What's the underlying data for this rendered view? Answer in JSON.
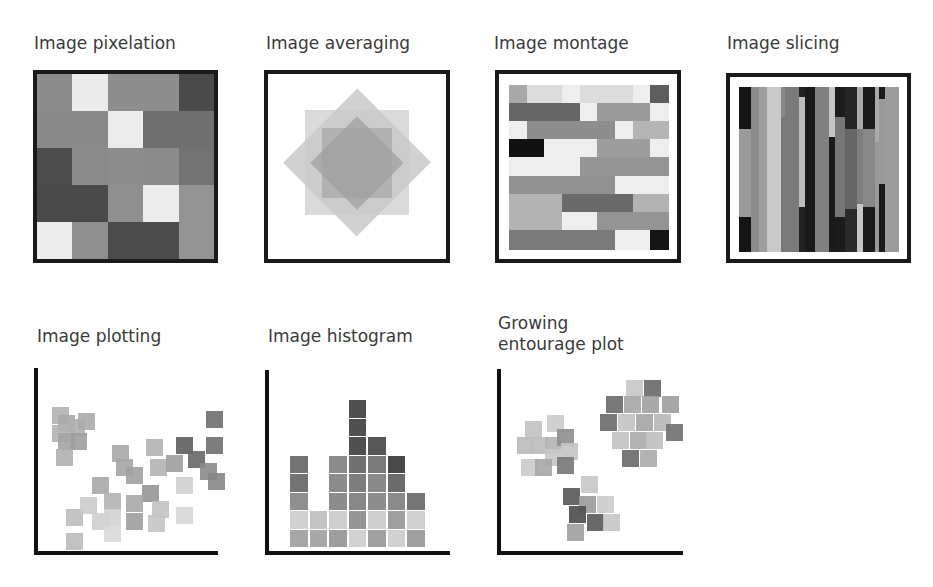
{
  "panels": [
    {
      "id": "pixelation",
      "title": "Image pixelation"
    },
    {
      "id": "averaging",
      "title": "Image averaging"
    },
    {
      "id": "montage",
      "title": "Image montage"
    },
    {
      "id": "slicing",
      "title": "Image slicing"
    },
    {
      "id": "plotting",
      "title": "Image plotting"
    },
    {
      "id": "histogram",
      "title": "Image histogram"
    },
    {
      "id": "entourage",
      "title_line1": "Growing",
      "title_line2": "entourage plot"
    }
  ],
  "pixelation_grid": {
    "rows": 5,
    "cols": 5,
    "shades": [
      [
        "#8c8c8c",
        "#ebebeb",
        "#8e8e8e",
        "#8e8e8e",
        "#4a4a4a"
      ],
      [
        "#8a8a8a",
        "#8a8a8a",
        "#ececec",
        "#6f6f6f",
        "#707070"
      ],
      [
        "#4d4d4d",
        "#8b8b8b",
        "#8d8d8d",
        "#8b8b8b",
        "#727272"
      ],
      [
        "#4a4a4a",
        "#4a4a4a",
        "#8f8f8f",
        "#ececec",
        "#949494"
      ],
      [
        "#ececec",
        "#8f8f8f",
        "#4b4b4b",
        "#4b4b4b",
        "#949494"
      ]
    ]
  },
  "averaging_shapes": [
    {
      "type": "square",
      "color": "#d9d9d9"
    },
    {
      "type": "diamond",
      "color": "#c8c8c8"
    },
    {
      "type": "inner-square",
      "color": "#b4b4b4"
    },
    {
      "type": "inner-diamond",
      "color": "#a3a3a3"
    }
  ],
  "montage_grid": {
    "rows": 9,
    "cols": 9,
    "shades": [
      [
        "#a9a9a9",
        "#dcdcdc",
        "#dcdcdc",
        "#eeeeee",
        "#dcdcdc",
        "#dcdcdc",
        "#dcdcdc",
        "#eeeeee",
        "#5e5e5e"
      ],
      [
        "#666666",
        "#666666",
        "#666666",
        "#666666",
        "#eeeeee",
        "#9a9a9a",
        "#9a9a9a",
        "#9a9a9a",
        "#eeeeee"
      ],
      [
        "#eeeeee",
        "#8e8e8e",
        "#8e8e8e",
        "#8e8e8e",
        "#8e8e8e",
        "#8e8e8e",
        "#eeeeee",
        "#b5b5b5",
        "#b5b5b5"
      ],
      [
        "#111111",
        "#111111",
        "#eeeeee",
        "#eeeeee",
        "#eeeeee",
        "#9d9d9d",
        "#9d9d9d",
        "#9d9d9d",
        "#eeeeee"
      ],
      [
        "#eeeeee",
        "#eeeeee",
        "#eeeeee",
        "#eeeeee",
        "#959595",
        "#959595",
        "#959595",
        "#959595",
        "#959595"
      ],
      [
        "#909090",
        "#909090",
        "#909090",
        "#909090",
        "#909090",
        "#909090",
        "#eeeeee",
        "#eeeeee",
        "#eeeeee"
      ],
      [
        "#b3b3b3",
        "#b3b3b3",
        "#b3b3b3",
        "#6a6a6a",
        "#6a6a6a",
        "#6a6a6a",
        "#6a6a6a",
        "#b3b3b3",
        "#b3b3b3"
      ],
      [
        "#b3b3b3",
        "#b3b3b3",
        "#b3b3b3",
        "#eeeeee",
        "#eeeeee",
        "#949494",
        "#949494",
        "#949494",
        "#949494"
      ],
      [
        "#7a7a7a",
        "#7a7a7a",
        "#7a7a7a",
        "#7a7a7a",
        "#7a7a7a",
        "#7a7a7a",
        "#eeeeee",
        "#eeeeee",
        "#151515"
      ]
    ]
  },
  "slicing_strips": [
    {
      "x": 0,
      "w": 12,
      "segments": [
        {
          "y": 0,
          "h": 42,
          "c": "#151515"
        },
        {
          "y": 42,
          "h": 88,
          "c": "#9a9a9a"
        },
        {
          "y": 130,
          "h": 35,
          "c": "#151515"
        }
      ]
    },
    {
      "x": 12,
      "w": 8,
      "segments": [
        {
          "y": 0,
          "h": 165,
          "c": "#8a8a8a"
        }
      ]
    },
    {
      "x": 20,
      "w": 8,
      "segments": [
        {
          "y": 0,
          "h": 165,
          "c": "#9e9e9e"
        }
      ]
    },
    {
      "x": 28,
      "w": 14,
      "segments": [
        {
          "y": 0,
          "h": 165,
          "c": "#c9c9c9"
        }
      ]
    },
    {
      "x": 42,
      "w": 4,
      "segments": [
        {
          "y": 0,
          "h": 30,
          "c": "#888"
        },
        {
          "y": 30,
          "h": 135,
          "c": "#777"
        }
      ]
    },
    {
      "x": 46,
      "w": 14,
      "segments": [
        {
          "y": 0,
          "h": 165,
          "c": "#7a7a7a"
        }
      ]
    },
    {
      "x": 60,
      "w": 6,
      "segments": [
        {
          "y": 0,
          "h": 10,
          "c": "#222"
        },
        {
          "y": 10,
          "h": 110,
          "c": "#bdbdbd"
        },
        {
          "y": 120,
          "h": 45,
          "c": "#222"
        }
      ]
    },
    {
      "x": 66,
      "w": 10,
      "segments": [
        {
          "y": 0,
          "h": 165,
          "c": "#1a1a1a"
        }
      ]
    },
    {
      "x": 76,
      "w": 14,
      "segments": [
        {
          "y": 0,
          "h": 165,
          "c": "#808080"
        }
      ]
    },
    {
      "x": 90,
      "w": 6,
      "segments": [
        {
          "y": 0,
          "h": 50,
          "c": "#c5c5c5"
        },
        {
          "y": 50,
          "h": 115,
          "c": "#1a1a1a"
        }
      ]
    },
    {
      "x": 96,
      "w": 10,
      "segments": [
        {
          "y": 0,
          "h": 30,
          "c": "#1c1c1c"
        },
        {
          "y": 30,
          "h": 100,
          "c": "#777"
        },
        {
          "y": 130,
          "h": 35,
          "c": "#1c1c1c"
        }
      ]
    },
    {
      "x": 106,
      "w": 12,
      "segments": [
        {
          "y": 0,
          "h": 42,
          "c": "#262626"
        },
        {
          "y": 42,
          "h": 80,
          "c": "#666"
        },
        {
          "y": 122,
          "h": 43,
          "c": "#2a2a2a"
        }
      ]
    },
    {
      "x": 118,
      "w": 6,
      "segments": [
        {
          "y": 0,
          "h": 42,
          "c": "#aaa"
        },
        {
          "y": 42,
          "h": 75,
          "c": "#7d7d7d"
        },
        {
          "y": 117,
          "h": 48,
          "c": "#c6c6c6"
        }
      ]
    },
    {
      "x": 124,
      "w": 12,
      "segments": [
        {
          "y": 0,
          "h": 42,
          "c": "#1a1a1a"
        },
        {
          "y": 42,
          "h": 78,
          "c": "#888"
        },
        {
          "y": 120,
          "h": 45,
          "c": "#1a1a1a"
        }
      ]
    },
    {
      "x": 136,
      "w": 4,
      "segments": [
        {
          "y": 0,
          "h": 55,
          "c": "#aaa"
        },
        {
          "y": 55,
          "h": 110,
          "c": "#999"
        }
      ]
    },
    {
      "x": 140,
      "w": 6,
      "segments": [
        {
          "y": 0,
          "h": 12,
          "c": "#1a1a1a"
        },
        {
          "y": 12,
          "h": 85,
          "c": "#9a9a9a"
        },
        {
          "y": 97,
          "h": 68,
          "c": "#1a1a1a"
        }
      ]
    },
    {
      "x": 146,
      "w": 14,
      "segments": [
        {
          "y": 0,
          "h": 165,
          "c": "#9c9c9c"
        }
      ]
    }
  ],
  "plotting_points": [
    {
      "x": 8,
      "y": 22,
      "c": "#b3b3b3"
    },
    {
      "x": 14,
      "y": 30,
      "c": "#a8a8a8"
    },
    {
      "x": 24,
      "y": 34,
      "c": "#b0b0b0"
    },
    {
      "x": 34,
      "y": 28,
      "c": "#ababab"
    },
    {
      "x": 8,
      "y": 40,
      "c": "#b2b2b2"
    },
    {
      "x": 14,
      "y": 48,
      "c": "#a3a3a3"
    },
    {
      "x": 26,
      "y": 48,
      "c": "#9f9f9f"
    },
    {
      "x": 12,
      "y": 64,
      "c": "#b0b0b0"
    },
    {
      "x": 68,
      "y": 60,
      "c": "#a9a9a9"
    },
    {
      "x": 72,
      "y": 74,
      "c": "#a5a5a5"
    },
    {
      "x": 82,
      "y": 82,
      "c": "#a0a0a0"
    },
    {
      "x": 48,
      "y": 92,
      "c": "#a8a8a8"
    },
    {
      "x": 98,
      "y": 100,
      "c": "#969696"
    },
    {
      "x": 60,
      "y": 108,
      "c": "#b2b2b2"
    },
    {
      "x": 82,
      "y": 110,
      "c": "#a9a9a9"
    },
    {
      "x": 108,
      "y": 116,
      "c": "#c1c1c1"
    },
    {
      "x": 22,
      "y": 124,
      "c": "#bdbdbd"
    },
    {
      "x": 48,
      "y": 128,
      "c": "#cfcfcf"
    },
    {
      "x": 60,
      "y": 124,
      "c": "#d3d3d3"
    },
    {
      "x": 82,
      "y": 128,
      "c": "#9f9f9f"
    },
    {
      "x": 104,
      "y": 130,
      "c": "#c4c4c4"
    },
    {
      "x": 22,
      "y": 148,
      "c": "#bbbbbb"
    },
    {
      "x": 60,
      "y": 140,
      "c": "#d8d8d8"
    },
    {
      "x": 106,
      "y": 74,
      "c": "#b3b3b3"
    },
    {
      "x": 102,
      "y": 54,
      "c": "#b3b3b3"
    },
    {
      "x": 122,
      "y": 70,
      "c": "#9e9e9e"
    },
    {
      "x": 132,
      "y": 52,
      "c": "#5e5e5e"
    },
    {
      "x": 144,
      "y": 66,
      "c": "#676767"
    },
    {
      "x": 156,
      "y": 78,
      "c": "#8a8a8a"
    },
    {
      "x": 164,
      "y": 88,
      "c": "#868686"
    },
    {
      "x": 132,
      "y": 92,
      "c": "#cfcfcf"
    },
    {
      "x": 132,
      "y": 122,
      "c": "#d6d6d6"
    },
    {
      "x": 162,
      "y": 52,
      "c": "#6f6f6f"
    },
    {
      "x": 162,
      "y": 26,
      "c": "#6e6e6e"
    },
    {
      "x": 36,
      "y": 112,
      "c": "#cccccc"
    }
  ],
  "chart_data": {
    "type": "bar",
    "title": "Image histogram",
    "categories": [
      "1",
      "2",
      "3",
      "4",
      "5",
      "6",
      "7"
    ],
    "values": [
      5,
      2,
      5,
      8,
      6,
      5,
      3
    ],
    "xlabel": "",
    "ylabel": "",
    "ylim": [
      0,
      9
    ],
    "grid": false,
    "stack_shades": [
      [
        "#a7a7a7",
        "#d0d0d0",
        "#8f8f8f",
        "#737373",
        "#737373"
      ],
      [
        "#a8a8a8",
        "#c4c4c4"
      ],
      [
        "#9e9e9e",
        "#cfcfcf",
        "#8c8c8c",
        "#8c8c8c",
        "#8c8c8c"
      ],
      [
        "#d2d2d2",
        "#959595",
        "#878787",
        "#7d7d7d",
        "#717171",
        "#505050",
        "#505050",
        "#505050"
      ],
      [
        "#a1a1a1",
        "#cfcfcf",
        "#8e8e8e",
        "#8a8a8a",
        "#7a7a7a",
        "#575757"
      ],
      [
        "#d0d0d0",
        "#a0a0a0",
        "#8b8b8b",
        "#6c6c6c",
        "#494949"
      ],
      [
        "#9f9f9f",
        "#d0d0d0",
        "#757575"
      ]
    ]
  },
  "entourage_clusters": [
    {
      "name": "cluster-left",
      "points": [
        {
          "x": 12,
          "y": 24,
          "c": "#c2c2c2"
        },
        {
          "x": 34,
          "y": 18,
          "c": "#cbcbcb"
        },
        {
          "x": 4,
          "y": 40,
          "c": "#bcbcbc"
        },
        {
          "x": 18,
          "y": 40,
          "c": "#bdbdbd"
        },
        {
          "x": 32,
          "y": 40,
          "c": "#b5b5b5"
        },
        {
          "x": 44,
          "y": 32,
          "c": "#8f8f8f"
        },
        {
          "x": 48,
          "y": 46,
          "c": "#c4c4c4"
        },
        {
          "x": 32,
          "y": 52,
          "c": "#c8c8c8"
        },
        {
          "x": 8,
          "y": 62,
          "c": "#cbcbcb"
        },
        {
          "x": 22,
          "y": 62,
          "c": "#a8a8a8"
        },
        {
          "x": 44,
          "y": 60,
          "c": "#7a7a7a"
        }
      ]
    },
    {
      "name": "cluster-right",
      "points": [
        {
          "x": 26,
          "y": 0,
          "c": "#c8c8c8"
        },
        {
          "x": 44,
          "y": 0,
          "c": "#6b6b6b"
        },
        {
          "x": 6,
          "y": 16,
          "c": "#6c6c6c"
        },
        {
          "x": 24,
          "y": 16,
          "c": "#a7a7a7"
        },
        {
          "x": 42,
          "y": 16,
          "c": "#a3a3a3"
        },
        {
          "x": 62,
          "y": 16,
          "c": "#a0a0a0"
        },
        {
          "x": 0,
          "y": 34,
          "c": "#6c6c6c"
        },
        {
          "x": 18,
          "y": 34,
          "c": "#c3c3c3"
        },
        {
          "x": 36,
          "y": 34,
          "c": "#a6a6a6"
        },
        {
          "x": 54,
          "y": 34,
          "c": "#b8b8b8"
        },
        {
          "x": 66,
          "y": 44,
          "c": "#727272"
        },
        {
          "x": 12,
          "y": 52,
          "c": "#c3c3c3"
        },
        {
          "x": 30,
          "y": 52,
          "c": "#acacac"
        },
        {
          "x": 46,
          "y": 52,
          "c": "#c0c0c0"
        },
        {
          "x": 22,
          "y": 70,
          "c": "#6d6d6d"
        },
        {
          "x": 40,
          "y": 70,
          "c": "#adadad"
        }
      ]
    },
    {
      "name": "cluster-bottom",
      "points": [
        {
          "x": 18,
          "y": 0,
          "c": "#c8c8c8"
        },
        {
          "x": 0,
          "y": 12,
          "c": "#5a5a5a"
        },
        {
          "x": 16,
          "y": 20,
          "c": "#9b9b9b"
        },
        {
          "x": 34,
          "y": 20,
          "c": "#cbcbcb"
        },
        {
          "x": 6,
          "y": 30,
          "c": "#4f4f4f"
        },
        {
          "x": 24,
          "y": 38,
          "c": "#5c5c5c"
        },
        {
          "x": 40,
          "y": 38,
          "c": "#c7c7c7"
        },
        {
          "x": 4,
          "y": 48,
          "c": "#a2a2a2"
        }
      ]
    }
  ]
}
